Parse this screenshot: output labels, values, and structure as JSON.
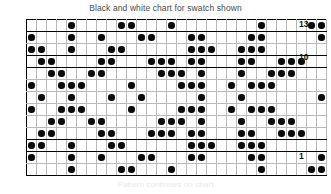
{
  "title": "Black and white chart for swatch shown",
  "caption": "Pattern continues on chart",
  "colors": {
    "dot": "#0a0a0a",
    "grid_line": "#b9b9b9",
    "border": "#000000",
    "title_text": "#4a4a4a",
    "label_text": "#111111",
    "background": "#ffffff"
  },
  "row_labels": [
    {
      "text": "13",
      "row": 13
    },
    {
      "text": "10",
      "row": 10
    },
    {
      "text": "1",
      "row": 1
    }
  ],
  "chart_data": {
    "type": "heatmap",
    "title": "Black and white chart for swatch shown",
    "xlabel": "",
    "ylabel": "",
    "columns": 30,
    "rows": 13,
    "grid": true,
    "legend": "none",
    "row_numbering": "bottom-to-top",
    "visible_row_labels": [
      "13",
      "10",
      "1"
    ],
    "cell_values_note": "1 = filled black dot (colorwork stitch), 0 = empty cell",
    "band_rows": [
      1,
      3,
      4,
      10,
      11,
      13
    ],
    "rows_bottom_to_top": [
      {
        "row": 1,
        "filled_columns": [
          5,
          10,
          11,
          15,
          24,
          29,
          30
        ]
      },
      {
        "row": 2,
        "filled_columns": [
          1,
          5,
          8,
          12,
          13,
          17,
          18,
          23,
          24,
          30
        ]
      },
      {
        "row": 3,
        "filled_columns": [
          1,
          2,
          5,
          9,
          10,
          17,
          18,
          19,
          22,
          23,
          24
        ]
      },
      {
        "row": 4,
        "filled_columns": [
          2,
          3,
          8,
          9,
          13,
          14,
          15,
          17,
          18,
          22,
          23,
          26,
          27,
          28
        ]
      },
      {
        "row": 5,
        "filled_columns": [
          3,
          4,
          7,
          8,
          14,
          15,
          16,
          18,
          22,
          25,
          26,
          27
        ]
      },
      {
        "row": 6,
        "filled_columns": [
          1,
          4,
          5,
          6,
          11,
          16,
          17,
          18,
          21,
          23,
          24,
          25
        ]
      },
      {
        "row": 7,
        "filled_columns": [
          2,
          5,
          9,
          12,
          18,
          22,
          30
        ]
      },
      {
        "row": 8,
        "filled_columns": [
          1,
          4,
          5,
          6,
          11,
          16,
          17,
          18,
          21,
          23,
          24,
          25
        ]
      },
      {
        "row": 9,
        "filled_columns": [
          3,
          4,
          7,
          8,
          14,
          15,
          16,
          18,
          22,
          25,
          26,
          27
        ]
      },
      {
        "row": 10,
        "filled_columns": [
          2,
          3,
          8,
          9,
          13,
          14,
          15,
          17,
          18,
          22,
          23,
          26,
          27,
          28
        ]
      },
      {
        "row": 11,
        "filled_columns": [
          1,
          2,
          5,
          9,
          10,
          17,
          18,
          19,
          22,
          23,
          24
        ]
      },
      {
        "row": 12,
        "filled_columns": [
          1,
          5,
          8,
          12,
          13,
          17,
          18,
          23,
          24,
          30
        ]
      },
      {
        "row": 13,
        "filled_columns": [
          5,
          10,
          11,
          15,
          24,
          29,
          30
        ]
      }
    ]
  }
}
